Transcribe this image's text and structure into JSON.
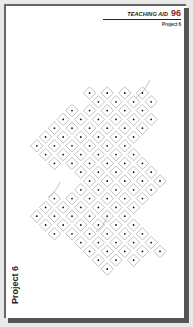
{
  "header": {
    "title": "TEACHING AID",
    "page_number": "96",
    "subtitle": "Project 6"
  },
  "side_label": "Project 6",
  "pattern": {
    "description": "kolam-style dot grid with diamond loops",
    "dot_color": "#111111",
    "line_color": "#999999",
    "rows": [
      {
        "row": 0,
        "cols": [
          7,
          9,
          11,
          13
        ]
      },
      {
        "row": 1,
        "cols": [
          8,
          10,
          12,
          14
        ]
      },
      {
        "row": 2,
        "cols": [
          5,
          7,
          9,
          11,
          13
        ]
      },
      {
        "row": 3,
        "cols": [
          4,
          6,
          8,
          10,
          12,
          14
        ]
      },
      {
        "row": 4,
        "cols": [
          3,
          5,
          7,
          9,
          11,
          13
        ]
      },
      {
        "row": 5,
        "cols": [
          2,
          4,
          6,
          8,
          10,
          12
        ]
      },
      {
        "row": 6,
        "cols": [
          1,
          3,
          5,
          7,
          9,
          11
        ]
      },
      {
        "row": 7,
        "cols": [
          2,
          4,
          6,
          8,
          10,
          12
        ]
      },
      {
        "row": 8,
        "cols": [
          3,
          5,
          7,
          9,
          11,
          13
        ]
      },
      {
        "row": 9,
        "cols": [
          6,
          8,
          10,
          12,
          14
        ]
      },
      {
        "row": 10,
        "cols": [
          7,
          9,
          11,
          13,
          15
        ]
      },
      {
        "row": 11,
        "cols": [
          6,
          8,
          10,
          12,
          14
        ]
      },
      {
        "row": 12,
        "cols": [
          3,
          5,
          7,
          9,
          11,
          13
        ]
      },
      {
        "row": 13,
        "cols": [
          2,
          4,
          6,
          8,
          10,
          12
        ]
      },
      {
        "row": 14,
        "cols": [
          1,
          3,
          5,
          7,
          9,
          11
        ]
      },
      {
        "row": 15,
        "cols": [
          2,
          4,
          6,
          8,
          10,
          12
        ]
      },
      {
        "row": 16,
        "cols": [
          3,
          5,
          7,
          9,
          11,
          13
        ]
      },
      {
        "row": 17,
        "cols": [
          6,
          8,
          10,
          12,
          14
        ]
      },
      {
        "row": 18,
        "cols": [
          7,
          9,
          11,
          13,
          15
        ]
      },
      {
        "row": 19,
        "cols": [
          8,
          10,
          12
        ]
      },
      {
        "row": 20,
        "cols": [
          9
        ]
      }
    ]
  }
}
